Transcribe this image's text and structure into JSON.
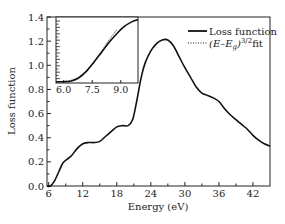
{
  "chart_data": {
    "type": "line",
    "title": "",
    "xlabel": "Energy (eV)",
    "ylabel": "Loss function",
    "xlim": [
      5.7,
      45
    ],
    "ylim": [
      0,
      1.4
    ],
    "x_ticks": [
      6,
      12,
      18,
      24,
      30,
      36,
      42
    ],
    "y_ticks": [
      0.0,
      0.2,
      0.4,
      0.6,
      0.8,
      1.0,
      1.2,
      1.4
    ],
    "x_tick_labels": [
      "6",
      "12",
      "18",
      "24",
      "30",
      "36",
      "42"
    ],
    "y_tick_labels": [
      "0.0",
      "0.2",
      "0.4",
      "0.6",
      "0.8",
      "1.0",
      "1.2",
      "1.4"
    ],
    "grid": false,
    "legend_position": "upper right",
    "series": [
      {
        "name": "Loss function",
        "style": "solid",
        "x": [
          5.7,
          6.3,
          7.0,
          7.8,
          8.5,
          9.2,
          10.0,
          11.0,
          12.0,
          13.0,
          14.0,
          15.0,
          16.0,
          17.0,
          18.0,
          19.0,
          20.0,
          20.8,
          21.5,
          22.3,
          23.0,
          24.0,
          25.0,
          26.0,
          27.0,
          28.0,
          29.0,
          30.0,
          31.0,
          32.0,
          33.0,
          34.0,
          35.0,
          36.0,
          37.0,
          38.0,
          39.0,
          40.0,
          41.0,
          42.0,
          43.0,
          44.0,
          45.0
        ],
        "y": [
          0.0,
          0.0,
          0.04,
          0.12,
          0.19,
          0.22,
          0.25,
          0.31,
          0.35,
          0.36,
          0.36,
          0.37,
          0.41,
          0.45,
          0.49,
          0.5,
          0.5,
          0.55,
          0.7,
          0.9,
          1.02,
          1.12,
          1.18,
          1.21,
          1.21,
          1.16,
          1.07,
          0.98,
          0.9,
          0.82,
          0.77,
          0.75,
          0.73,
          0.7,
          0.64,
          0.59,
          0.55,
          0.51,
          0.47,
          0.42,
          0.38,
          0.35,
          0.33
        ]
      }
    ],
    "inset": {
      "xlim": [
        5.6,
        9.9
      ],
      "ylim": [
        0,
        1.0
      ],
      "x_ticks": [
        6.0,
        7.5,
        9.0
      ],
      "x_tick_labels": [
        "6.0",
        "7.5",
        "9.0"
      ],
      "series": [
        {
          "name": "Loss function",
          "style": "solid",
          "x": [
            5.6,
            6.0,
            6.4,
            6.8,
            7.2,
            7.6,
            8.0,
            8.4,
            8.8,
            9.2,
            9.6,
            9.9
          ],
          "y": [
            0.02,
            0.02,
            0.03,
            0.08,
            0.18,
            0.32,
            0.47,
            0.62,
            0.75,
            0.86,
            0.93,
            0.96
          ]
        },
        {
          "name": "(E-E_g)^{3/2} fit",
          "style": "dotted",
          "x": [
            6.0,
            6.4,
            6.8,
            7.2,
            7.6,
            8.0,
            8.4,
            8.8
          ],
          "y": [
            0.02,
            0.04,
            0.09,
            0.19,
            0.33,
            0.49,
            0.66,
            0.81
          ]
        }
      ]
    },
    "legend": [
      {
        "label": "Loss function",
        "style": "solid"
      },
      {
        "label": "(E–E_g)^{3/2}fit",
        "style": "dotted"
      }
    ]
  },
  "labels": {
    "xlabel": "Energy (eV)",
    "ylabel": "Loss function",
    "legend_solid": "Loss function",
    "legend_dotted_base": "(E–E",
    "legend_dotted_sub": "g",
    "legend_dotted_close": ")",
    "legend_dotted_sup": "3/2",
    "legend_dotted_tail": "fit"
  }
}
